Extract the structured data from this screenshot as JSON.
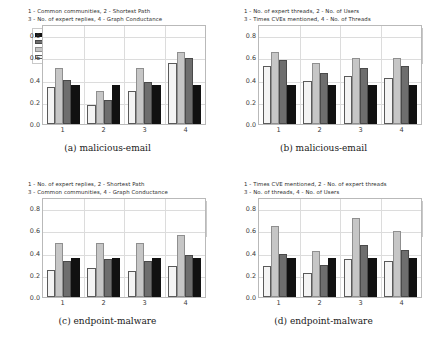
{
  "figure": {
    "legend_entries": [
      {
        "label": "Random - F1",
        "key": "random",
        "color": "#111111"
      },
      {
        "label": "F1",
        "key": "f1",
        "color": "#6e6e6e"
      },
      {
        "label": "recall",
        "key": "recall",
        "color": "#c6c6c6"
      },
      {
        "label": "precision",
        "key": "precision",
        "color": "#f4f4f4"
      }
    ],
    "yticks": [
      "0.0",
      "0.2",
      "0.4",
      "0.6",
      "0.8"
    ],
    "xticks": [
      "1",
      "2",
      "3",
      "4"
    ]
  },
  "panels": [
    {
      "id": "a",
      "caption": "(a)  malicious-email",
      "key_text": "1 - Common communities, 2 - Shortest Path\n3 - No. of expert replies, 4 - Graph Conductance",
      "legend_position": "left",
      "chart_data": {
        "type": "bar",
        "title": "(a)  malicious-email",
        "xlabel": "",
        "ylabel": "",
        "ylim": [
          0,
          0.9
        ],
        "yticks": [
          0.0,
          0.2,
          0.4,
          0.6,
          0.8
        ],
        "grid": true,
        "legend_position": "upper left",
        "categories": [
          "1",
          "2",
          "3",
          "4"
        ],
        "series": [
          {
            "name": "precision",
            "values": [
              0.33,
              0.17,
              0.3,
              0.55
            ]
          },
          {
            "name": "recall",
            "values": [
              0.5,
              0.3,
              0.5,
              0.65
            ]
          },
          {
            "name": "F1",
            "values": [
              0.4,
              0.22,
              0.38,
              0.59
            ]
          },
          {
            "name": "Random - F1",
            "values": [
              0.35,
              0.35,
              0.35,
              0.35
            ]
          }
        ]
      }
    },
    {
      "id": "b",
      "caption": "(b)  malicious-email",
      "key_text": "1 - No. of expert threads, 2 - No. of Users\n3 - Times CVEs mentioned, 4 - No. of Threads",
      "legend_position": "right",
      "chart_data": {
        "type": "bar",
        "title": "(b)  malicious-email",
        "xlabel": "",
        "ylabel": "",
        "ylim": [
          0,
          0.9
        ],
        "yticks": [
          0.0,
          0.2,
          0.4,
          0.6,
          0.8
        ],
        "grid": true,
        "legend_position": "upper right",
        "categories": [
          "1",
          "2",
          "3",
          "4"
        ],
        "series": [
          {
            "name": "precision",
            "values": [
              0.52,
              0.39,
              0.43,
              0.415
            ]
          },
          {
            "name": "recall",
            "values": [
              0.645,
              0.55,
              0.595,
              0.59
            ]
          },
          {
            "name": "F1",
            "values": [
              0.58,
              0.455,
              0.5,
              0.52
            ]
          },
          {
            "name": "Random - F1",
            "values": [
              0.35,
              0.35,
              0.35,
              0.35
            ]
          }
        ]
      }
    },
    {
      "id": "c",
      "caption": "(c)  endpoint-malware",
      "key_text": "1 - No. of expert replies, 2 - Shortest Path\n3 - Common communities, 4 - Graph Conductance",
      "legend_position": "right",
      "chart_data": {
        "type": "bar",
        "title": "(c)  endpoint-malware",
        "xlabel": "",
        "ylabel": "",
        "ylim": [
          0,
          0.9
        ],
        "yticks": [
          0.0,
          0.2,
          0.4,
          0.6,
          0.8
        ],
        "grid": true,
        "legend_position": "upper right",
        "categories": [
          "1",
          "2",
          "3",
          "4"
        ],
        "series": [
          {
            "name": "precision",
            "values": [
              0.24,
              0.26,
              0.23,
              0.28
            ]
          },
          {
            "name": "recall",
            "values": [
              0.485,
              0.485,
              0.485,
              0.56
            ]
          },
          {
            "name": "F1",
            "values": [
              0.32,
              0.34,
              0.32,
              0.375
            ]
          },
          {
            "name": "Random - F1",
            "values": [
              0.35,
              0.35,
              0.35,
              0.35
            ]
          }
        ]
      }
    },
    {
      "id": "d",
      "caption": "(d)  endpoint-malware",
      "key_text": "1 - Times CVE mentioned, 2 - No. of expert threads\n3 - No. of threads, 4 - No. of Users",
      "legend_position": "right",
      "chart_data": {
        "type": "bar",
        "title": "(d)  endpoint-malware",
        "xlabel": "",
        "ylabel": "",
        "ylim": [
          0,
          0.9
        ],
        "yticks": [
          0.0,
          0.2,
          0.4,
          0.6,
          0.8
        ],
        "grid": true,
        "legend_position": "upper right",
        "categories": [
          "1",
          "2",
          "3",
          "4"
        ],
        "series": [
          {
            "name": "precision",
            "values": [
              0.275,
              0.22,
              0.345,
              0.32
            ]
          },
          {
            "name": "recall",
            "values": [
              0.64,
              0.41,
              0.71,
              0.595
            ]
          },
          {
            "name": "F1",
            "values": [
              0.39,
              0.285,
              0.465,
              0.42
            ]
          },
          {
            "name": "Random - F1",
            "values": [
              0.35,
              0.35,
              0.35,
              0.35
            ]
          }
        ]
      }
    }
  ]
}
